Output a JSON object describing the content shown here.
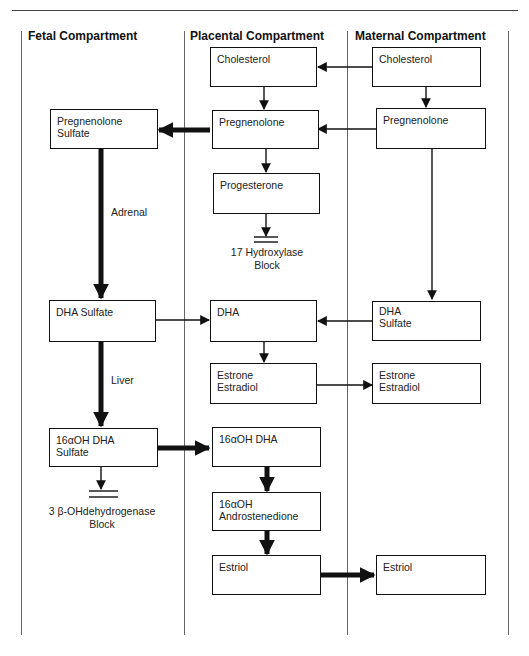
{
  "headers": {
    "fetal": "Fetal Compartment",
    "placental": "Placental Compartment",
    "maternal": "Maternal Compartment"
  },
  "nodes": {
    "placental_cholesterol": [
      "Cholesterol"
    ],
    "maternal_cholesterol": [
      "Cholesterol"
    ],
    "fetal_pregnenolone_sulfate": [
      "Pregnenolone",
      "Sulfate"
    ],
    "placental_pregnenolone": [
      "Pregnenolone"
    ],
    "maternal_pregnenolone": [
      "Pregnenolone"
    ],
    "placental_progesterone": [
      "Progesterone"
    ],
    "fetal_dha_sulfate": [
      "DHA Sulfate"
    ],
    "placental_dha": [
      "DHA"
    ],
    "maternal_dha_sulfate": [
      "DHA",
      "Sulfate"
    ],
    "placental_estrone_estradiol": [
      "Estrone",
      "Estradiol"
    ],
    "maternal_estrone_estradiol": [
      "Estrone",
      "Estradiol"
    ],
    "fetal_16aoh_dha_sulfate": [
      "16αOH DHA",
      "Sulfate"
    ],
    "placental_16aoh_dha": [
      "16αOH DHA"
    ],
    "placental_16aoh_androstenedione": [
      "16αOH",
      "Androstenedione"
    ],
    "placental_estriol": [
      "Estriol"
    ],
    "maternal_estriol": [
      "Estriol"
    ]
  },
  "labels": {
    "adrenal": "Adrenal",
    "liver": "Liver",
    "hydroxylase_block_1": "17 Hydroxylase",
    "hydroxylase_block_2": "Block",
    "dehydrogenase_block_1": "3 β-OHdehydrogenase",
    "dehydrogenase_block_2": "Block"
  },
  "edges": [
    {
      "from": "maternal_cholesterol",
      "to": "placental_cholesterol",
      "weight": "thin"
    },
    {
      "from": "placental_cholesterol",
      "to": "placental_pregnenolone",
      "weight": "thin"
    },
    {
      "from": "maternal_cholesterol",
      "to": "maternal_pregnenolone",
      "weight": "thin"
    },
    {
      "from": "maternal_pregnenolone",
      "to": "placental_pregnenolone",
      "weight": "thin"
    },
    {
      "from": "placental_pregnenolone",
      "to": "fetal_pregnenolone_sulfate",
      "weight": "thick"
    },
    {
      "from": "placental_pregnenolone",
      "to": "placental_progesterone",
      "weight": "thin"
    },
    {
      "from": "placental_progesterone",
      "to": "17 Hydroxylase Block",
      "weight": "thin"
    },
    {
      "from": "fetal_pregnenolone_sulfate",
      "to": "fetal_dha_sulfate",
      "weight": "thick",
      "label": "Adrenal"
    },
    {
      "from": "maternal_pregnenolone",
      "to": "maternal_dha_sulfate",
      "weight": "thin"
    },
    {
      "from": "fetal_dha_sulfate",
      "to": "placental_dha",
      "weight": "thin"
    },
    {
      "from": "maternal_dha_sulfate",
      "to": "placental_dha",
      "weight": "thin"
    },
    {
      "from": "placental_dha",
      "to": "placental_estrone_estradiol",
      "weight": "thin"
    },
    {
      "from": "placental_estrone_estradiol",
      "to": "maternal_estrone_estradiol",
      "weight": "thin"
    },
    {
      "from": "fetal_dha_sulfate",
      "to": "fetal_16aoh_dha_sulfate",
      "weight": "thick",
      "label": "Liver"
    },
    {
      "from": "fetal_16aoh_dha_sulfate",
      "to": "3 beta-OHdehydrogenase Block",
      "weight": "thin"
    },
    {
      "from": "fetal_16aoh_dha_sulfate",
      "to": "placental_16aoh_dha",
      "weight": "thick"
    },
    {
      "from": "placental_16aoh_dha",
      "to": "placental_16aoh_androstenedione",
      "weight": "thick"
    },
    {
      "from": "placental_16aoh_androstenedione",
      "to": "placental_estriol",
      "weight": "thick"
    },
    {
      "from": "placental_estriol",
      "to": "maternal_estriol",
      "weight": "thick"
    }
  ]
}
